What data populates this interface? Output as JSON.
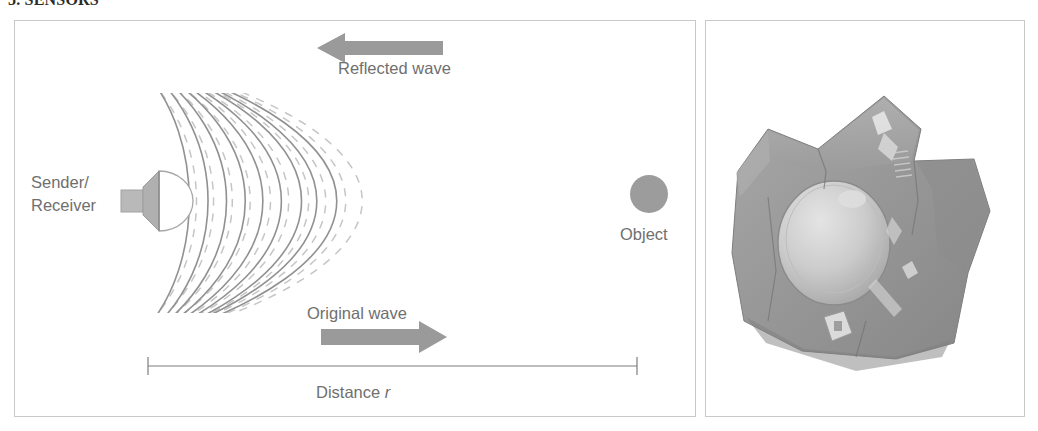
{
  "section": {
    "heading": "5. SENSORS"
  },
  "diagram": {
    "labels": {
      "reflected_wave": "Reflected wave",
      "original_wave": "Original wave",
      "sender_line1": "Sender/",
      "sender_line2": "Receiver",
      "object": "Object",
      "distance_prefix": "Distance ",
      "distance_symbol": "r"
    },
    "colors": {
      "arrow_fill": "#9a9a9a",
      "solid_wave": "#8c8c8c",
      "dashed_wave": "#c4c4c4",
      "object_fill": "#9c9c9c",
      "transducer_fill": "#b5b5b5",
      "text": "#6f6f6f",
      "panel_border": "#c9c9c9",
      "dimension_line": "#7a7a7a"
    },
    "wave_arcs": {
      "solid_count": 9,
      "dashed_count": 10,
      "origin_x": 150,
      "first_solid_radius": 52,
      "radius_step": 58
    }
  },
  "photo": {
    "caption": "Ultrasonic sensor module photograph",
    "alt": "grayscale photo of an ultrasonic sensor module with round transducer",
    "colors": {
      "body_dark": "#8e8e8e",
      "body_mid": "#a0a0a0",
      "body_light": "#b8b8b8",
      "transducer": "#cfcfcf",
      "highlight": "#e2e2e2"
    }
  }
}
